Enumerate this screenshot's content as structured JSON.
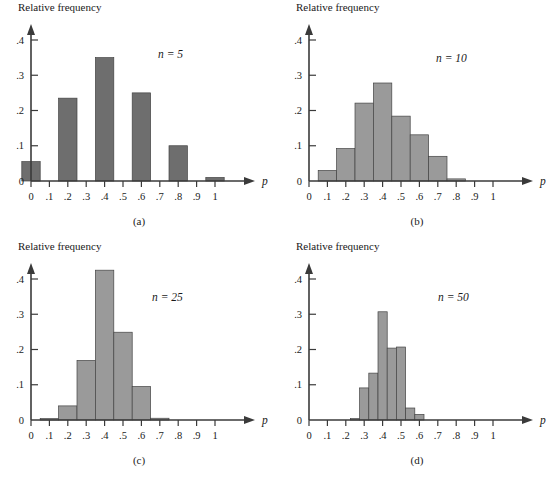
{
  "figure": {
    "y_axis_title": "Relative frequency",
    "x_axis_symbol": "p"
  },
  "chart_data": [
    {
      "type": "bar",
      "id": "a",
      "caption": "(a)",
      "title": "",
      "annotation": "n = 5",
      "ylabel": "Relative frequency",
      "xlabel": "p",
      "bar_color": "#6e6e6e",
      "bar_width": 0.1,
      "grid": false,
      "legend": "none",
      "xlim": [
        0,
        1.08
      ],
      "ylim": [
        0,
        0.44
      ],
      "xticks": [
        0,
        0.1,
        0.2,
        0.3,
        0.4,
        0.5,
        0.6,
        0.7,
        0.8,
        0.9,
        1
      ],
      "xtick_labels": [
        "0",
        ".1",
        ".2",
        ".3",
        ".4",
        ".5",
        ".6",
        ".7",
        ".8",
        ".9",
        "1"
      ],
      "yticks": [
        0,
        0.1,
        0.2,
        0.3,
        0.4
      ],
      "ytick_labels": [
        "0",
        ".1",
        ".2",
        ".3",
        ".4"
      ],
      "bin_centers": [
        0,
        0.2,
        0.4,
        0.6,
        0.8,
        1
      ],
      "values": [
        0.055,
        0.235,
        0.35,
        0.25,
        0.1,
        0.01
      ]
    },
    {
      "type": "bar",
      "id": "b",
      "caption": "(b)",
      "title": "",
      "annotation": "n = 10",
      "ylabel": "Relative frequency",
      "xlabel": "p",
      "bar_color": "#9a9a9a",
      "bar_width": 0.1,
      "grid": false,
      "legend": "none",
      "xlim": [
        0,
        1.08
      ],
      "ylim": [
        0,
        0.44
      ],
      "xticks": [
        0,
        0.1,
        0.2,
        0.3,
        0.4,
        0.5,
        0.6,
        0.7,
        0.8,
        0.9,
        1
      ],
      "xtick_labels": [
        "0",
        ".1",
        ".2",
        ".3",
        ".4",
        ".5",
        ".6",
        ".7",
        ".8",
        ".9",
        "1"
      ],
      "yticks": [
        0,
        0.1,
        0.2,
        0.3,
        0.4
      ],
      "ytick_labels": [
        "0",
        ".1",
        ".2",
        ".3",
        ".4"
      ],
      "bin_centers": [
        0.1,
        0.2,
        0.3,
        0.4,
        0.5,
        0.6,
        0.7,
        0.8
      ],
      "values": [
        0.03,
        0.092,
        0.221,
        0.278,
        0.184,
        0.131,
        0.07,
        0.006
      ]
    },
    {
      "type": "bar",
      "id": "c",
      "caption": "(c)",
      "title": "",
      "annotation": "n = 25",
      "ylabel": "Relative frequency",
      "xlabel": "p",
      "bar_color": "#9a9a9a",
      "bar_width": 0.1,
      "grid": false,
      "legend": "none",
      "xlim": [
        0,
        1.08
      ],
      "ylim": [
        0,
        0.46
      ],
      "xticks": [
        0,
        0.1,
        0.2,
        0.3,
        0.4,
        0.5,
        0.6,
        0.7,
        0.8,
        0.9,
        1
      ],
      "xtick_labels": [
        "0",
        ".1",
        ".2",
        ".3",
        ".4",
        ".5",
        ".6",
        ".7",
        ".8",
        ".9",
        "1"
      ],
      "yticks": [
        0,
        0.1,
        0.2,
        0.3,
        0.4
      ],
      "ytick_labels": [
        "0",
        ".1",
        ".2",
        ".3",
        ".4"
      ],
      "bin_centers": [
        0.1,
        0.2,
        0.3,
        0.4,
        0.5,
        0.6,
        0.7
      ],
      "values": [
        0.004,
        0.04,
        0.169,
        0.425,
        0.249,
        0.095,
        0.005
      ]
    },
    {
      "type": "bar",
      "id": "d",
      "caption": "(d)",
      "title": "",
      "annotation": "n = 50",
      "ylabel": "Relative frequency",
      "xlabel": "p",
      "bar_color": "#9a9a9a",
      "bar_width": 0.05,
      "grid": false,
      "legend": "none",
      "xlim": [
        0,
        1.08
      ],
      "ylim": [
        0,
        0.44
      ],
      "xticks": [
        0,
        0.1,
        0.2,
        0.3,
        0.4,
        0.5,
        0.6,
        0.7,
        0.8,
        0.9,
        1
      ],
      "xtick_labels": [
        "0",
        ".1",
        ".2",
        ".3",
        ".4",
        ".5",
        ".6",
        ".7",
        ".8",
        ".9",
        "1"
      ],
      "yticks": [
        0,
        0.1,
        0.2,
        0.3,
        0.4
      ],
      "ytick_labels": [
        "0",
        ".1",
        ".2",
        ".3",
        ".4"
      ],
      "bin_centers": [
        0.25,
        0.3,
        0.35,
        0.4,
        0.45,
        0.5,
        0.55,
        0.6
      ],
      "values": [
        0.004,
        0.091,
        0.133,
        0.307,
        0.204,
        0.207,
        0.034,
        0.016
      ]
    }
  ]
}
